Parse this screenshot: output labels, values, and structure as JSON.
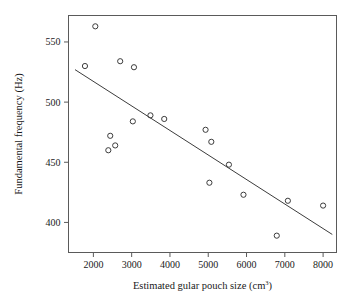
{
  "chart_data": {
    "type": "scatter",
    "title": "",
    "xlabel": "Estimated gular pouch size (cm3)",
    "xlabel_base": "Estimated gular pouch size (cm",
    "xlabel_sup": "3",
    "xlabel_tail": ")",
    "ylabel": "Fundamental frequency (Hz)",
    "xlim": [
      1350,
      8350
    ],
    "ylim": [
      375,
      572
    ],
    "xticks": [
      2000,
      3000,
      4000,
      5000,
      6000,
      7000,
      8000
    ],
    "xtick_labels": [
      "2000",
      "3000",
      "4000",
      "5000",
      "6000",
      "7000",
      "8000"
    ],
    "yticks": [
      400,
      450,
      500,
      550
    ],
    "ytick_labels": [
      "400",
      "450",
      "500",
      "550"
    ],
    "grid": false,
    "legend": "none",
    "marker": "open-circle",
    "marker_color": "#3c3c3c",
    "points": [
      {
        "x": 1780,
        "y": 530
      },
      {
        "x": 2050,
        "y": 563
      },
      {
        "x": 2390,
        "y": 460
      },
      {
        "x": 2440,
        "y": 472
      },
      {
        "x": 2570,
        "y": 464
      },
      {
        "x": 2700,
        "y": 534
      },
      {
        "x": 3030,
        "y": 484
      },
      {
        "x": 3060,
        "y": 529
      },
      {
        "x": 3490,
        "y": 489
      },
      {
        "x": 3850,
        "y": 486
      },
      {
        "x": 4930,
        "y": 477
      },
      {
        "x": 5030,
        "y": 433
      },
      {
        "x": 5080,
        "y": 467
      },
      {
        "x": 5540,
        "y": 448
      },
      {
        "x": 5920,
        "y": 423
      },
      {
        "x": 6790,
        "y": 389
      },
      {
        "x": 7080,
        "y": 418
      },
      {
        "x": 8000,
        "y": 414
      }
    ],
    "fit_line": {
      "type": "linear-regression",
      "x1": 1520,
      "y1": 527,
      "x2": 8240,
      "y2": 390,
      "color": "#3c3c3c"
    }
  }
}
